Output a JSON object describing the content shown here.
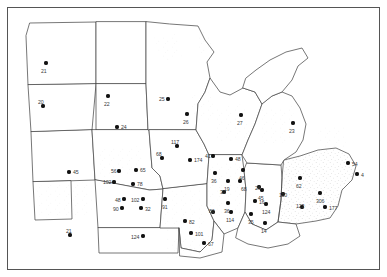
{
  "figure": {
    "type": "dot-distribution-map",
    "region": "United States Midwest and Great Plains",
    "frame_color": "#555555",
    "state_outline_color": "#4a4a4a",
    "dot_color": "#111111",
    "label_color": "#3a3a3a",
    "background_color": "#ffffff",
    "stipple_color": "#b9b9b9"
  },
  "chart_data": {
    "type": "scatter",
    "title": "",
    "xlabel": "",
    "ylabel": "",
    "grid": false,
    "legend": null,
    "point_label_meaning": "sample count at site",
    "points": [
      {
        "label": "21",
        "x": 46,
        "y": 63
      },
      {
        "label": "20",
        "x": 43,
        "y": 106
      },
      {
        "label": "22",
        "x": 108,
        "y": 96
      },
      {
        "label": "24",
        "x": 117,
        "y": 127
      },
      {
        "label": "25",
        "x": 168,
        "y": 99
      },
      {
        "label": "26",
        "x": 187,
        "y": 114
      },
      {
        "label": "27",
        "x": 241,
        "y": 115
      },
      {
        "label": "23",
        "x": 293,
        "y": 123
      },
      {
        "label": "117",
        "x": 177,
        "y": 146
      },
      {
        "label": "68",
        "x": 162,
        "y": 158
      },
      {
        "label": "174",
        "x": 190,
        "y": 160
      },
      {
        "label": "41",
        "x": 213,
        "y": 156
      },
      {
        "label": "48",
        "x": 231,
        "y": 159
      },
      {
        "label": "45",
        "x": 69,
        "y": 172
      },
      {
        "label": "56",
        "x": 119,
        "y": 171
      },
      {
        "label": "65",
        "x": 136,
        "y": 170
      },
      {
        "label": "102",
        "x": 114,
        "y": 182
      },
      {
        "label": "78",
        "x": 133,
        "y": 184
      },
      {
        "label": "46",
        "x": 243,
        "y": 170
      },
      {
        "label": "36",
        "x": 215,
        "y": 173
      },
      {
        "label": "19",
        "x": 228,
        "y": 181
      },
      {
        "label": "68b",
        "x": 240,
        "y": 181
      },
      {
        "label": "62",
        "x": 300,
        "y": 178
      },
      {
        "label": "54",
        "x": 348,
        "y": 163
      },
      {
        "label": "4",
        "x": 357,
        "y": 174
      },
      {
        "label": "48b",
        "x": 124,
        "y": 199
      },
      {
        "label": "102b",
        "x": 143,
        "y": 199
      },
      {
        "label": "90",
        "x": 122,
        "y": 208
      },
      {
        "label": "32",
        "x": 141,
        "y": 208
      },
      {
        "label": "91",
        "x": 165,
        "y": 199
      },
      {
        "label": "26b",
        "x": 259,
        "y": 187
      },
      {
        "label": "32b",
        "x": 224,
        "y": 192
      },
      {
        "label": "45b",
        "x": 262,
        "y": 190
      },
      {
        "label": "110",
        "x": 283,
        "y": 194
      },
      {
        "label": "16",
        "x": 255,
        "y": 201
      },
      {
        "label": "36b",
        "x": 228,
        "y": 203
      },
      {
        "label": "124",
        "x": 266,
        "y": 204
      },
      {
        "label": "306",
        "x": 320,
        "y": 193
      },
      {
        "label": "123",
        "x": 302,
        "y": 207
      },
      {
        "label": "177",
        "x": 325,
        "y": 207
      },
      {
        "label": "86",
        "x": 213,
        "y": 212
      },
      {
        "label": "114",
        "x": 231,
        "y": 212
      },
      {
        "label": "35",
        "x": 251,
        "y": 214
      },
      {
        "label": "82",
        "x": 185,
        "y": 221
      },
      {
        "label": "14",
        "x": 265,
        "y": 223
      },
      {
        "label": "101",
        "x": 191,
        "y": 233
      },
      {
        "label": "21b",
        "x": 70,
        "y": 235
      },
      {
        "label": "124b",
        "x": 143,
        "y": 236
      },
      {
        "label": "67",
        "x": 204,
        "y": 243
      }
    ],
    "label_text": {
      "21": "21",
      "20": "20",
      "22": "22",
      "24": "24",
      "25": "25",
      "26": "26",
      "27": "27",
      "23": "23",
      "117": "117",
      "68": "68",
      "174": "174",
      "41": "41",
      "48": "48",
      "45": "45",
      "56": "56",
      "65": "65",
      "102": "102",
      "78": "78",
      "46": "46",
      "36": "36",
      "19": "19",
      "68b": "68",
      "62": "62",
      "54": "54",
      "4": "4",
      "48b": "48",
      "102b": "102",
      "90": "90",
      "32": "32",
      "91": "91",
      "26b": "26",
      "32b": "32",
      "45b": "45",
      "110": "110",
      "16": "16",
      "36b": "36",
      "124": "124",
      "306": "306",
      "123": "123",
      "177": "177",
      "86": "86",
      "114": "114",
      "35": "35",
      "82": "82",
      "14": "14",
      "101": "101",
      "21b": "21",
      "124b": "124",
      "67": "67"
    }
  },
  "labels": [
    {
      "id": "21",
      "text": "21",
      "x": 41,
      "y": 69,
      "anchor": "below"
    },
    {
      "id": "20",
      "text": "20",
      "x": 38,
      "y": 100,
      "anchor": "above-left"
    },
    {
      "id": "22",
      "text": "22",
      "x": 104,
      "y": 102,
      "anchor": "below"
    },
    {
      "id": "24",
      "text": "24",
      "x": 121,
      "y": 125,
      "anchor": "right"
    },
    {
      "id": "25",
      "text": "25",
      "x": 159,
      "y": 97,
      "anchor": "left"
    },
    {
      "id": "26",
      "text": "26",
      "x": 183,
      "y": 120,
      "anchor": "below"
    },
    {
      "id": "27",
      "text": "27",
      "x": 237,
      "y": 121,
      "anchor": "below"
    },
    {
      "id": "23",
      "text": "23",
      "x": 289,
      "y": 129,
      "anchor": "below"
    },
    {
      "id": "117",
      "text": "117",
      "x": 171,
      "y": 140,
      "anchor": "above"
    },
    {
      "id": "68",
      "text": "68",
      "x": 156,
      "y": 152,
      "anchor": "above"
    },
    {
      "id": "174",
      "text": "174",
      "x": 194,
      "y": 158,
      "anchor": "right"
    },
    {
      "id": "41",
      "text": "41",
      "x": 205,
      "y": 154,
      "anchor": "left"
    },
    {
      "id": "48",
      "text": "48",
      "x": 235,
      "y": 157,
      "anchor": "right"
    },
    {
      "id": "45",
      "text": "45",
      "x": 73,
      "y": 170,
      "anchor": "right"
    },
    {
      "id": "56",
      "text": "56",
      "x": 111,
      "y": 169,
      "anchor": "left"
    },
    {
      "id": "65",
      "text": "65",
      "x": 140,
      "y": 168,
      "anchor": "right"
    },
    {
      "id": "102",
      "text": "102",
      "x": 103,
      "y": 180,
      "anchor": "left"
    },
    {
      "id": "78",
      "text": "78",
      "x": 137,
      "y": 182,
      "anchor": "right"
    },
    {
      "id": "46",
      "text": "46",
      "x": 239,
      "y": 176,
      "anchor": "below"
    },
    {
      "id": "36",
      "text": "36",
      "x": 211,
      "y": 179,
      "anchor": "below"
    },
    {
      "id": "19",
      "text": "19",
      "x": 224,
      "y": 187,
      "anchor": "below"
    },
    {
      "id": "68b",
      "text": "68",
      "x": 241,
      "y": 187,
      "anchor": "below"
    },
    {
      "id": "62",
      "text": "62",
      "x": 296,
      "y": 184,
      "anchor": "below"
    },
    {
      "id": "54",
      "text": "54",
      "x": 352,
      "y": 162,
      "anchor": "right"
    },
    {
      "id": "4",
      "text": "4",
      "x": 361,
      "y": 173,
      "anchor": "right"
    },
    {
      "id": "48b",
      "text": "48",
      "x": 115,
      "y": 198,
      "anchor": "left"
    },
    {
      "id": "102b",
      "text": "102",
      "x": 131,
      "y": 198,
      "anchor": "left"
    },
    {
      "id": "90",
      "text": "90",
      "x": 113,
      "y": 207,
      "anchor": "left"
    },
    {
      "id": "32",
      "text": "32",
      "x": 145,
      "y": 207,
      "anchor": "right"
    },
    {
      "id": "91",
      "text": "91",
      "x": 162,
      "y": 205,
      "anchor": "below"
    },
    {
      "id": "26b",
      "text": "26",
      "x": 255,
      "y": 186,
      "anchor": "left"
    },
    {
      "id": "32b",
      "text": "32",
      "x": 220,
      "y": 190,
      "anchor": "left"
    },
    {
      "id": "45b",
      "text": "45",
      "x": 258,
      "y": 196,
      "anchor": "below"
    },
    {
      "id": "110",
      "text": "110",
      "x": 279,
      "y": 193,
      "anchor": "left"
    },
    {
      "id": "16",
      "text": "16",
      "x": 259,
      "y": 200,
      "anchor": "right"
    },
    {
      "id": "36b",
      "text": "36",
      "x": 224,
      "y": 209,
      "anchor": "below"
    },
    {
      "id": "124",
      "text": "124",
      "x": 262,
      "y": 210,
      "anchor": "below"
    },
    {
      "id": "306",
      "text": "306",
      "x": 316,
      "y": 199,
      "anchor": "below"
    },
    {
      "id": "123",
      "text": "123",
      "x": 296,
      "y": 204,
      "anchor": "left"
    },
    {
      "id": "177",
      "text": "177",
      "x": 329,
      "y": 206,
      "anchor": "right"
    },
    {
      "id": "86",
      "text": "86",
      "x": 209,
      "y": 209,
      "anchor": "left"
    },
    {
      "id": "114",
      "text": "114",
      "x": 226,
      "y": 218,
      "anchor": "below"
    },
    {
      "id": "35",
      "text": "35",
      "x": 248,
      "y": 220,
      "anchor": "below"
    },
    {
      "id": "82",
      "text": "82",
      "x": 189,
      "y": 220,
      "anchor": "right"
    },
    {
      "id": "14",
      "text": "14",
      "x": 261,
      "y": 229,
      "anchor": "below"
    },
    {
      "id": "101",
      "text": "101",
      "x": 195,
      "y": 232,
      "anchor": "right"
    },
    {
      "id": "21b",
      "text": "21",
      "x": 66,
      "y": 229,
      "anchor": "above"
    },
    {
      "id": "124b",
      "text": "124",
      "x": 131,
      "y": 235,
      "anchor": "left"
    },
    {
      "id": "67",
      "text": "67",
      "x": 208,
      "y": 242,
      "anchor": "right"
    }
  ]
}
